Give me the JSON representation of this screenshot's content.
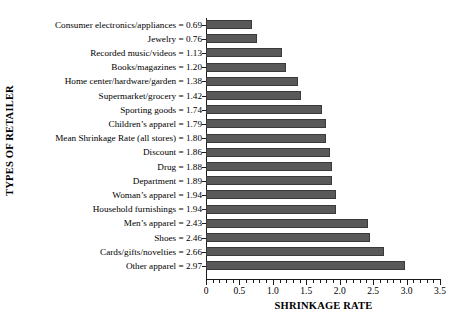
{
  "chart_data": {
    "type": "bar",
    "orientation": "horizontal",
    "title": "",
    "xlabel": "SHRINKAGE RATE",
    "ylabel": "TYPES OF RETAILER",
    "xlim": [
      0,
      3.5
    ],
    "xticks": [
      0,
      0.5,
      1.0,
      1.5,
      2.0,
      2.5,
      3.0,
      3.5
    ],
    "xtick_labels": [
      "0",
      "0.5",
      "1.0",
      "1.5",
      "2.0",
      "2.5",
      "3.0",
      "3.5"
    ],
    "minor_tick_step": 0.1,
    "grid": false,
    "legend": false,
    "bar_color": "#59595a",
    "bar_edge_color": "#3a3a3b",
    "background": "#ffffff",
    "categories": [
      "Consumer electronics/appliances",
      "Jewelry",
      "Recorded music/videos",
      "Books/magazines",
      "Home center/hardware/garden",
      "Supermarket/grocery",
      "Sporting goods",
      "Children’s apparel",
      "Mean Shrinkage Rate (all stores)",
      "Discount",
      "Drug",
      "Department",
      "Woman’s apparel",
      "Household furnishings",
      "Men’s apparel",
      "Shoes",
      "Cards/gifts/novelties",
      "Other apparel"
    ],
    "values": [
      0.69,
      0.76,
      1.13,
      1.2,
      1.38,
      1.42,
      1.74,
      1.79,
      1.8,
      1.86,
      1.88,
      1.89,
      1.94,
      1.94,
      2.43,
      2.46,
      2.66,
      2.97
    ],
    "tick_labels": [
      "Consumer electronics/appliances = 0.69",
      "Jewelry = 0.76",
      "Recorded music/videos = 1.13",
      "Books/magazines = 1.20",
      "Home center/hardware/garden = 1.38",
      "Supermarket/grocery = 1.42",
      "Sporting goods = 1.74",
      "Children’s apparel = 1.79",
      "Mean Shrinkage Rate (all stores) = 1.80",
      "Discount = 1.86",
      "Drug = 1.88",
      "Department = 1.89",
      "Woman’s apparel = 1.94",
      "Household furnishings = 1.94",
      "Men’s apparel = 2.43",
      "Shoes = 2.46",
      "Cards/gifts/novelties = 2.66",
      "Other apparel = 2.97"
    ]
  }
}
